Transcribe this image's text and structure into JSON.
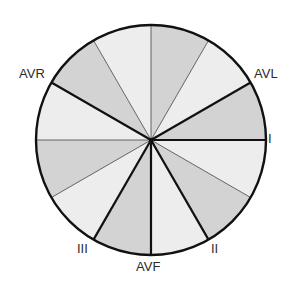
{
  "diagram": {
    "center": [
      151,
      140
    ],
    "radius": 115,
    "colors": {
      "sector_dark": "#d3d3d3",
      "sector_light": "#ededed",
      "outline": "#111111",
      "thin_line": "#555555",
      "label": "#2a2a2a"
    },
    "sectors": [
      {
        "from": 0,
        "to": 30,
        "shade": "light"
      },
      {
        "from": 30,
        "to": 60,
        "shade": "dark"
      },
      {
        "from": 60,
        "to": 90,
        "shade": "light"
      },
      {
        "from": 90,
        "to": 120,
        "shade": "dark"
      },
      {
        "from": 120,
        "to": 150,
        "shade": "light"
      },
      {
        "from": 150,
        "to": 180,
        "shade": "dark"
      },
      {
        "from": 180,
        "to": 210,
        "shade": "light"
      },
      {
        "from": 210,
        "to": 240,
        "shade": "dark"
      },
      {
        "from": 240,
        "to": 270,
        "shade": "light"
      },
      {
        "from": 270,
        "to": 300,
        "shade": "dark"
      },
      {
        "from": 300,
        "to": 330,
        "shade": "light"
      },
      {
        "from": 330,
        "to": 360,
        "shade": "dark"
      }
    ],
    "radii": [
      {
        "angle": 0,
        "weight": "thick",
        "lead": "I"
      },
      {
        "angle": 30,
        "weight": "thin"
      },
      {
        "angle": 60,
        "weight": "thick",
        "lead": "II"
      },
      {
        "angle": 90,
        "weight": "thick",
        "lead": "AVF"
      },
      {
        "angle": 120,
        "weight": "thick",
        "lead": "III"
      },
      {
        "angle": 150,
        "weight": "thin"
      },
      {
        "angle": 180,
        "weight": "thin"
      },
      {
        "angle": 210,
        "weight": "thick",
        "lead": "AVR"
      },
      {
        "angle": 240,
        "weight": "thin"
      },
      {
        "angle": 270,
        "weight": "thin"
      },
      {
        "angle": 300,
        "weight": "thin"
      },
      {
        "angle": 330,
        "weight": "thick",
        "lead": "AVL"
      }
    ],
    "labels": {
      "I": {
        "text": "I",
        "x": 268,
        "y": 132
      },
      "II": {
        "text": "II",
        "x": 211,
        "y": 242
      },
      "AVF": {
        "text": "AVF",
        "x": 136,
        "y": 260
      },
      "III": {
        "text": "III",
        "x": 77,
        "y": 242
      },
      "AVR": {
        "text": "AVR",
        "x": 19,
        "y": 67
      },
      "AVL": {
        "text": "AVL",
        "x": 254,
        "y": 67
      }
    }
  }
}
